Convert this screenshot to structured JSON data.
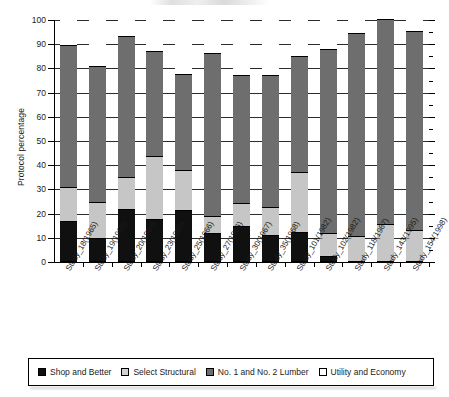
{
  "chart_data": {
    "type": "bar",
    "subtype": "stacked-bar-100-percent",
    "title": "",
    "xlabel": "",
    "ylabel": "Protocol percentage",
    "ylim": [
      0,
      100
    ],
    "yticks": [
      0,
      10,
      20,
      30,
      40,
      50,
      60,
      70,
      80,
      90,
      100
    ],
    "ytick_labels": [
      "0",
      "10",
      "20",
      "30",
      "40",
      "50",
      "60",
      "70",
      "80",
      "90",
      "100"
    ],
    "grid": true,
    "grid_axis": "y",
    "legend_position": "bottom",
    "categories": [
      "Study_18(1965)",
      "Study_19(1965)",
      "Study_20(1965)",
      "Study_23(1965)",
      "Study_25(1966)",
      "Study_27(1966)",
      "Study_30(1967)",
      "Study_35(1968)",
      "Study_101(1982)",
      "Study_102(1982)",
      "Study_118(1987)",
      "Study_143(1995)",
      "Study_154(1998)"
    ],
    "series": [
      {
        "name": "Shop and Better",
        "color": "#101010",
        "values": [
          16,
          9,
          21,
          17,
          20.5,
          11,
          14,
          10.5,
          11.5,
          1.5,
          0,
          0,
          0
        ]
      },
      {
        "name": "Select Structural",
        "color": "#c6c6c6",
        "values": [
          14,
          15,
          13.5,
          26,
          16.5,
          7,
          9.5,
          11.5,
          25,
          9.5,
          10,
          15,
          12.5
        ]
      },
      {
        "name": "No. 1 and No. 2 Lumber",
        "color": "#6e6e6e",
        "values": [
          59,
          56,
          58,
          43.5,
          40,
          67.5,
          53,
          54.5,
          48,
          76,
          84,
          84.5,
          82
        ]
      },
      {
        "name": "Utility and Economy",
        "color": "#ffffff",
        "values": [
          11,
          20,
          7.5,
          13.5,
          23,
          14.5,
          23.5,
          23.5,
          15.5,
          13,
          6,
          0.5,
          5.5
        ]
      }
    ],
    "cumulative_tops": [
      [
        16,
        30,
        89,
        100
      ],
      [
        9,
        24,
        80,
        100
      ],
      [
        21,
        34.5,
        92.5,
        100
      ],
      [
        17,
        43,
        86.5,
        100
      ],
      [
        20.5,
        37,
        77,
        100
      ],
      [
        11,
        18,
        85.5,
        100
      ],
      [
        14,
        23.5,
        76.5,
        100
      ],
      [
        10.5,
        22,
        76.5,
        100
      ],
      [
        11.5,
        36.5,
        84.5,
        100
      ],
      [
        1.5,
        11,
        87,
        100
      ],
      [
        0,
        10,
        94,
        100
      ],
      [
        0,
        15,
        99.5,
        100
      ],
      [
        0,
        12.5,
        94.5,
        100
      ]
    ]
  },
  "axis": {
    "y_title": "Protocol percentage"
  },
  "legend": {
    "items": [
      {
        "label": "Shop and Better",
        "swatch": "legend-swatch-shop-and-better",
        "color": "#101010"
      },
      {
        "label": "Select Structural",
        "swatch": "legend-swatch-select-structural",
        "color": "#d2d2d2"
      },
      {
        "label": "No. 1 and No. 2 Lumber",
        "swatch": "legend-swatch-no-1-and-no-2-lumber",
        "color": "#6e6e6e"
      },
      {
        "label": "Utility and Economy",
        "swatch": "legend-swatch-utility-and-economy",
        "color": "#ffffff"
      }
    ]
  }
}
